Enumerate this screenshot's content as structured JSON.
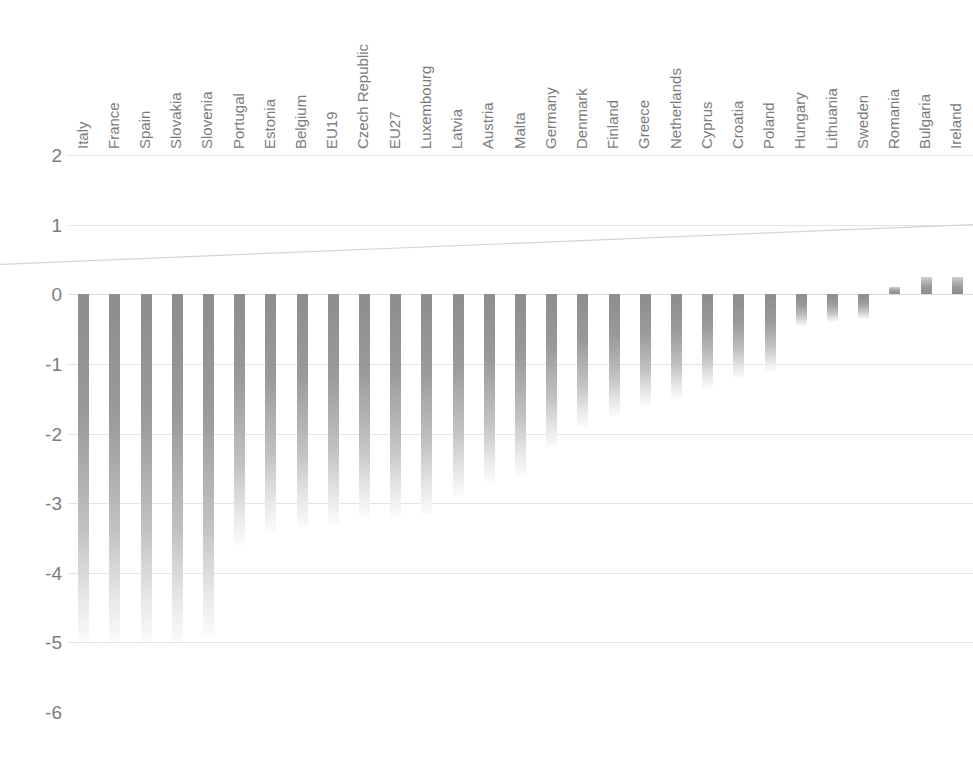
{
  "chart_data": {
    "type": "bar",
    "title": "",
    "subtitle": "",
    "xlabel": "",
    "ylabel": "",
    "ylim": [
      -6,
      2
    ],
    "yticks": [
      "2",
      "1",
      "0",
      "-1",
      "-2",
      "-3",
      "-4",
      "-5",
      "-6"
    ],
    "ytick_values": [
      2,
      1,
      0,
      -1,
      -2,
      -3,
      -4,
      -5,
      -6
    ],
    "grid": true,
    "legend": "none",
    "categories": [
      "Italy",
      "France",
      "Spain",
      "Slovakia",
      "Slovenia",
      "Portugal",
      "Estonia",
      "Belgium",
      "EU19",
      "Czech Republic",
      "EU27",
      "Luxembourg",
      "Latvia",
      "Austria",
      "Malta",
      "Germany",
      "Denmark",
      "Finland",
      "Greece",
      "Netherlands",
      "Cyprus",
      "Croatia",
      "Poland",
      "Hungary",
      "Lithuania",
      "Sweden",
      "Romania",
      "Bulgaria",
      "Ireland"
    ],
    "values": [
      -5.0,
      -5.0,
      -5.0,
      -5.0,
      -4.9,
      -3.6,
      -3.4,
      -3.35,
      -3.3,
      -3.2,
      -3.2,
      -3.15,
      -2.9,
      -2.7,
      -2.6,
      -2.2,
      -1.9,
      -1.75,
      -1.6,
      -1.5,
      -1.35,
      -1.2,
      -1.1,
      -0.45,
      -0.4,
      -0.35,
      0.1,
      0.25,
      0.25
    ],
    "series": [
      {
        "name": "change",
        "values": [
          -5.0,
          -5.0,
          -5.0,
          -5.0,
          -4.9,
          -3.6,
          -3.4,
          -3.35,
          -3.3,
          -3.2,
          -3.2,
          -3.15,
          -2.9,
          -2.7,
          -2.6,
          -2.2,
          -1.9,
          -1.75,
          -1.6,
          -1.5,
          -1.35,
          -1.2,
          -1.1,
          -0.45,
          -0.4,
          -0.35,
          0.1,
          0.25,
          0.25
        ]
      }
    ],
    "trendline": {
      "present": true,
      "start_value": 0.43,
      "end_value": 1.0,
      "style": "solid-thin-gray"
    },
    "bar_color": "#8a8a8a",
    "grid_color": "#e4e4e4",
    "text_color": "#7b7b7b",
    "caption": ""
  }
}
